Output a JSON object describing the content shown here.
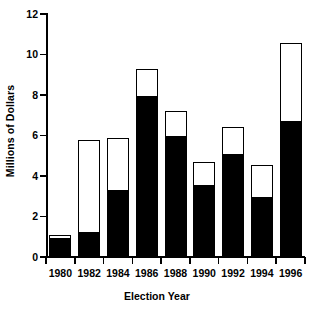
{
  "chart_data": {
    "type": "bar",
    "title": "",
    "xlabel": "Election Year",
    "ylabel": "Millions of Dollars",
    "categories": [
      "1980",
      "1982",
      "1984",
      "1986",
      "1988",
      "1990",
      "1992",
      "1994",
      "1996"
    ],
    "stacked": true,
    "series": [
      {
        "name": "filled",
        "color": "#000000",
        "values": [
          1.0,
          1.2,
          3.3,
          8.0,
          6.0,
          3.6,
          5.1,
          3.0,
          6.75
        ]
      },
      {
        "name": "open",
        "color": "#ffffff",
        "values": [
          0.1,
          4.6,
          2.6,
          1.3,
          1.2,
          1.1,
          1.3,
          1.55,
          3.8
        ]
      }
    ],
    "totals": [
      1.1,
      5.8,
      5.9,
      9.3,
      7.2,
      4.7,
      6.4,
      4.55,
      10.55
    ],
    "ylim": [
      0,
      12
    ],
    "yticks": [
      0,
      2,
      4,
      6,
      8,
      10,
      12
    ],
    "ytick_labels": [
      "0",
      "2",
      "4",
      "6",
      "8",
      "10",
      "12"
    ],
    "grid": false,
    "legend": "none",
    "bar_outline_color": "#000000",
    "background_color": "#ffffff"
  }
}
